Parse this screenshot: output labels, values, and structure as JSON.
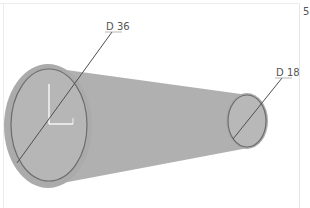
{
  "viewport": {
    "edge_label": "5",
    "background": "#ffffff",
    "shape_fill": "#b3b3b3",
    "shape_halo": "#a9a9a9",
    "outline_color": "#6d6d6d",
    "dimension_line_color": "#555555"
  },
  "dimensions": [
    {
      "id": "large-diameter",
      "label": "D 36"
    },
    {
      "id": "small-diameter",
      "label": "D 18"
    }
  ],
  "triad": {
    "color": "#ffffff"
  }
}
